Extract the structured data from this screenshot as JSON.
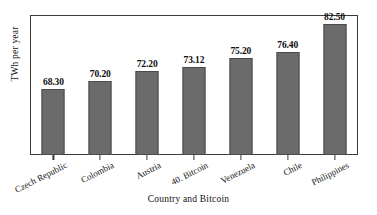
{
  "chart_data": {
    "type": "bar",
    "title": "",
    "xlabel": "Country and Bitcoin",
    "ylabel": "TWh per year",
    "categories": [
      "Czech Republic",
      "Colombia",
      "Austria",
      "40. Bitcoin",
      "Venezuela",
      "Chile",
      "Philippines"
    ],
    "values": [
      68.3,
      70.2,
      72.2,
      73.12,
      75.2,
      76.4,
      82.5
    ],
    "value_labels": [
      "68.30",
      "70.20",
      "72.20",
      "73.12",
      "75.20",
      "76.40",
      "82.50"
    ],
    "ylim": [
      54.0,
      84.5
    ],
    "y_tick_labels": [],
    "grid": false,
    "legend": null,
    "bar_color": "#6b6b6b",
    "bar_edge_color": "#4a4a4a",
    "frame_color": "#3a3a3a",
    "text_color": "#111111"
  }
}
